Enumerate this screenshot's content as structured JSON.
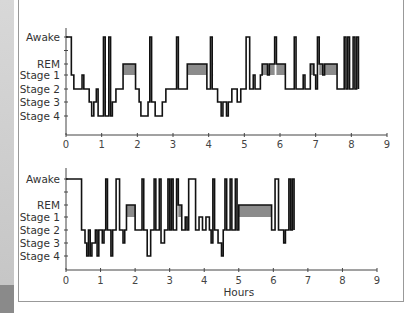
{
  "chart_data": [
    {
      "type": "line",
      "subtype": "hypnogram",
      "title": "",
      "xlabel": "",
      "ylabel": "",
      "xlim": [
        0,
        9
      ],
      "x_ticks": [
        "0",
        "1",
        "2",
        "3",
        "4",
        "5",
        "6",
        "7",
        "8",
        "9"
      ],
      "y_categories": [
        "Awake",
        "REM",
        "Stage 1",
        "Stage 2",
        "Stage 3",
        "Stage 4"
      ],
      "rem_fill_color": "#8c8c8c",
      "line_color": "#111111",
      "segments": [
        [
          0.0,
          "Awake"
        ],
        [
          0.15,
          "Stage 1"
        ],
        [
          0.22,
          "Stage 2"
        ],
        [
          0.45,
          "Stage 1"
        ],
        [
          0.5,
          "Stage 2"
        ],
        [
          0.65,
          "Stage 3"
        ],
        [
          0.72,
          "Stage 4"
        ],
        [
          0.78,
          "Stage 3"
        ],
        [
          0.85,
          "Stage 2"
        ],
        [
          0.9,
          "Stage 4"
        ],
        [
          1.0,
          "Stage 4"
        ],
        [
          1.05,
          "Awake"
        ],
        [
          1.1,
          "Stage 4"
        ],
        [
          1.2,
          "Awake"
        ],
        [
          1.25,
          "Stage 4"
        ],
        [
          1.3,
          "Stage 3"
        ],
        [
          1.4,
          "Stage 2"
        ],
        [
          1.6,
          "REM"
        ],
        [
          1.95,
          "Stage 2"
        ],
        [
          2.05,
          "Stage 3"
        ],
        [
          2.1,
          "Stage 4"
        ],
        [
          2.3,
          "Stage 3"
        ],
        [
          2.35,
          "Awake"
        ],
        [
          2.4,
          "Stage 3"
        ],
        [
          2.5,
          "Stage 4"
        ],
        [
          2.7,
          "Stage 3"
        ],
        [
          2.8,
          "Stage 2"
        ],
        [
          3.1,
          "Awake"
        ],
        [
          3.15,
          "Stage 2"
        ],
        [
          3.4,
          "REM"
        ],
        [
          3.95,
          "Stage 2"
        ],
        [
          4.05,
          "Awake"
        ],
        [
          4.1,
          "Stage 2"
        ],
        [
          4.25,
          "Stage 3"
        ],
        [
          4.35,
          "Stage 4"
        ],
        [
          4.4,
          "Stage 3"
        ],
        [
          4.5,
          "Stage 4"
        ],
        [
          4.55,
          "Stage 3"
        ],
        [
          4.65,
          "Stage 2"
        ],
        [
          4.8,
          "Stage 3"
        ],
        [
          4.9,
          "Stage 2"
        ],
        [
          5.05,
          "Awake"
        ],
        [
          5.15,
          "Stage 2"
        ],
        [
          5.25,
          "Stage 1"
        ],
        [
          5.3,
          "Stage 2"
        ],
        [
          5.45,
          "Stage 1"
        ],
        [
          5.5,
          "REM"
        ],
        [
          5.65,
          "Stage 1"
        ],
        [
          5.7,
          "REM"
        ],
        [
          5.85,
          "Awake"
        ],
        [
          5.9,
          "REM"
        ],
        [
          6.15,
          "Stage 2"
        ],
        [
          6.4,
          "Awake"
        ],
        [
          6.45,
          "Stage 2"
        ],
        [
          6.65,
          "Stage 1"
        ],
        [
          6.7,
          "Stage 2"
        ],
        [
          6.85,
          "REM"
        ],
        [
          6.95,
          "Stage 1"
        ],
        [
          7.0,
          "Stage 2"
        ],
        [
          7.05,
          "Awake"
        ],
        [
          7.1,
          "REM"
        ],
        [
          7.2,
          "Stage 1"
        ],
        [
          7.25,
          "REM"
        ],
        [
          7.6,
          "Stage 2"
        ],
        [
          7.8,
          "Awake"
        ],
        [
          7.85,
          "Stage 2"
        ],
        [
          7.9,
          "Awake"
        ],
        [
          7.95,
          "Stage 2"
        ],
        [
          8.05,
          "Awake"
        ],
        [
          8.1,
          "Stage 2"
        ],
        [
          8.15,
          "Awake"
        ],
        [
          8.2,
          "Stage 2"
        ],
        [
          8.2,
          "end"
        ]
      ]
    },
    {
      "type": "line",
      "subtype": "hypnogram",
      "title": "",
      "xlabel": "Hours",
      "ylabel": "",
      "xlim": [
        0,
        9
      ],
      "x_ticks": [
        "0",
        "1",
        "2",
        "3",
        "4",
        "5",
        "6",
        "7",
        "8",
        "9"
      ],
      "y_categories": [
        "Awake",
        "REM",
        "Stage 1",
        "Stage 2",
        "Stage 3",
        "Stage 4"
      ],
      "rem_fill_color": "#8c8c8c",
      "line_color": "#111111",
      "segments": [
        [
          0.0,
          "Awake"
        ],
        [
          0.45,
          "Stage 2"
        ],
        [
          0.55,
          "Stage 3"
        ],
        [
          0.6,
          "Stage 4"
        ],
        [
          0.65,
          "Stage 2"
        ],
        [
          0.7,
          "Stage 4"
        ],
        [
          0.75,
          "Stage 3"
        ],
        [
          0.85,
          "Stage 2"
        ],
        [
          0.9,
          "Stage 4"
        ],
        [
          0.95,
          "Stage 2"
        ],
        [
          1.05,
          "Stage 3"
        ],
        [
          1.1,
          "Stage 2"
        ],
        [
          1.15,
          "Awake"
        ],
        [
          1.2,
          "Stage 2"
        ],
        [
          1.3,
          "Stage 4"
        ],
        [
          1.35,
          "Stage 2"
        ],
        [
          1.45,
          "Awake"
        ],
        [
          1.55,
          "Stage 2"
        ],
        [
          1.65,
          "Stage 3"
        ],
        [
          1.7,
          "Stage 2"
        ],
        [
          1.75,
          "REM"
        ],
        [
          2.0,
          "Stage 2"
        ],
        [
          2.2,
          "Awake"
        ],
        [
          2.25,
          "Stage 2"
        ],
        [
          2.35,
          "Stage 4"
        ],
        [
          2.45,
          "Stage 2"
        ],
        [
          2.55,
          "Awake"
        ],
        [
          2.6,
          "Stage 2"
        ],
        [
          2.7,
          "Awake"
        ],
        [
          2.75,
          "Stage 3"
        ],
        [
          2.85,
          "Stage 2"
        ],
        [
          2.95,
          "Awake"
        ],
        [
          3.0,
          "Stage 2"
        ],
        [
          3.05,
          "Awake"
        ],
        [
          3.1,
          "Stage 2"
        ],
        [
          3.2,
          "Awake"
        ],
        [
          3.25,
          "REM"
        ],
        [
          3.35,
          "Stage 2"
        ],
        [
          3.45,
          "Stage 1"
        ],
        [
          3.5,
          "Stage 2"
        ],
        [
          3.55,
          "Awake"
        ],
        [
          3.75,
          "Stage 2"
        ],
        [
          3.85,
          "Stage 1"
        ],
        [
          3.95,
          "Stage 2"
        ],
        [
          4.05,
          "Stage 1"
        ],
        [
          4.15,
          "Stage 2"
        ],
        [
          4.2,
          "Stage 3"
        ],
        [
          4.25,
          "Awake"
        ],
        [
          4.3,
          "Stage 2"
        ],
        [
          4.4,
          "Stage 3"
        ],
        [
          4.5,
          "Stage 4"
        ],
        [
          4.55,
          "Stage 2"
        ],
        [
          4.6,
          "Awake"
        ],
        [
          4.65,
          "Stage 2"
        ],
        [
          4.75,
          "Awake"
        ],
        [
          4.8,
          "Stage 2"
        ],
        [
          4.9,
          "Awake"
        ],
        [
          4.95,
          "Stage 2"
        ],
        [
          5.0,
          "REM"
        ],
        [
          5.95,
          "Stage 2"
        ],
        [
          6.05,
          "Awake"
        ],
        [
          6.15,
          "Stage 2"
        ],
        [
          6.3,
          "Stage 3"
        ],
        [
          6.35,
          "Stage 2"
        ],
        [
          6.45,
          "Awake"
        ],
        [
          6.5,
          "Stage 2"
        ],
        [
          6.55,
          "Awake"
        ],
        [
          6.6,
          "Stage 2"
        ],
        [
          6.6,
          "end"
        ]
      ]
    }
  ]
}
